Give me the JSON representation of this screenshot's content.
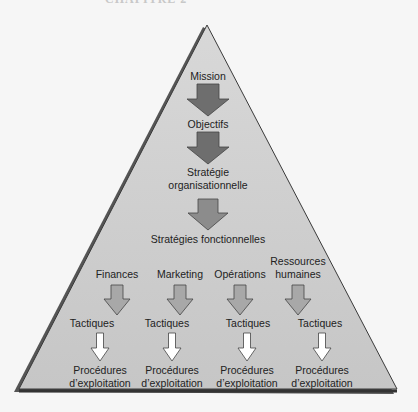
{
  "diagram": {
    "partial_heading": "CHAPITRE 2",
    "levels": {
      "mission": "Mission",
      "objectifs": "Objectifs",
      "strategie_org": [
        "Stratégie",
        "organisationnelle"
      ],
      "strategies_fonc": "Stratégies fonctionnelles"
    },
    "functions": [
      {
        "name": [
          "Finances"
        ],
        "tactics": "Tactiques",
        "procedures": [
          "Procédures",
          "d’exploitation"
        ]
      },
      {
        "name": [
          "Marketing"
        ],
        "tactics": "Tactiques",
        "procedures": [
          "Procédures",
          "d’exploitation"
        ]
      },
      {
        "name": [
          "Opérations"
        ],
        "tactics": "Tactiques",
        "procedures": [
          "Procédures",
          "d’exploitation"
        ]
      },
      {
        "name": [
          "Ressources",
          "humaines"
        ],
        "tactics": "Tactiques",
        "procedures": [
          "Procédures",
          "d’exploitation"
        ]
      }
    ],
    "colors": {
      "pyramid_fill": "#cfcfcf",
      "pyramid_edge": "#3a3a3a",
      "arrow_dark": "#6e6e6e",
      "arrow_mid": "#8c8c8c",
      "arrow_light": "#a8a8a8",
      "arrow_white": "#ffffff"
    }
  }
}
